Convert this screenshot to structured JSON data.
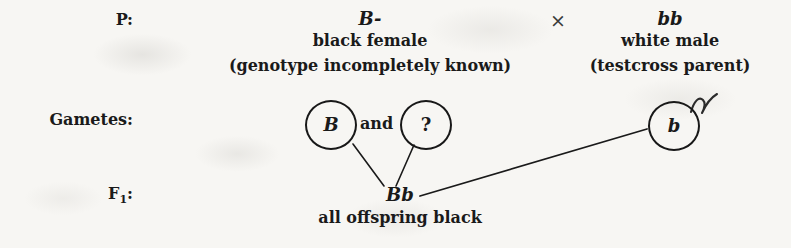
{
  "diagram": {
    "background_color": "#f7f6f3",
    "ink_color": "#1a1a1a",
    "rows": [
      {
        "id": "parental",
        "label": "P:"
      },
      {
        "id": "gametes",
        "label": "Gametes:"
      },
      {
        "id": "f1",
        "label": "F",
        "subscript": "1",
        "label_suffix": ":"
      }
    ],
    "cross_symbol": "×",
    "conjunction": "and",
    "parents": [
      {
        "id": "female-parent",
        "genotype": "B-",
        "description": "black female",
        "note": "(genotype incompletely known)"
      },
      {
        "id": "male-parent",
        "genotype": "bb",
        "description": "white male",
        "note": "(testcross parent)"
      }
    ],
    "gametes": [
      {
        "id": "gamete-B",
        "allele": "B"
      },
      {
        "id": "gamete-unknown",
        "allele": "?"
      },
      {
        "id": "gamete-b",
        "allele": "b"
      }
    ],
    "offspring": {
      "id": "f1-offspring",
      "genotype": "Bb",
      "description": "all offspring black"
    },
    "annotation": {
      "id": "handwritten-tick",
      "name": "check-mark-flourish",
      "near": "gamete-b"
    }
  }
}
